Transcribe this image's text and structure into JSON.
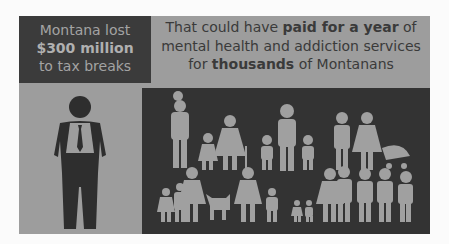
{
  "left_panel": {
    "line1": "Montana lost",
    "line2": "$300 million",
    "line3": "to tax breaks"
  },
  "headline": {
    "part1": "That could have ",
    "bold1": "paid for a year",
    "part2": " of mental health and addiction services for ",
    "bold2": "thousands",
    "part3": " of Montanans"
  },
  "icons": {
    "left": "businessman-icon",
    "right": "families-crowd-icon"
  },
  "colors": {
    "dark": "#3b3b3b",
    "mid_gray": "#9d9d9d",
    "figure": "#a0a0a0"
  }
}
